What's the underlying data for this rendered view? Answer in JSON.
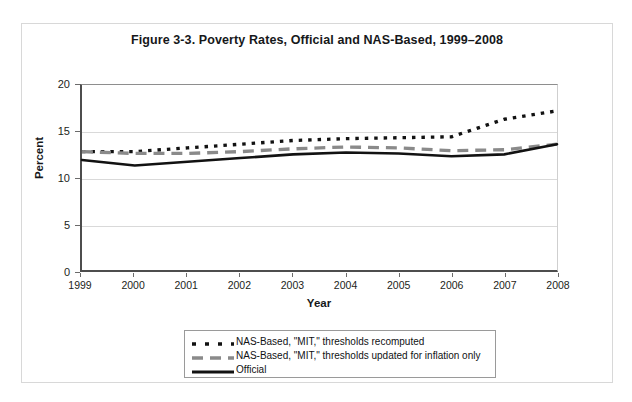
{
  "figure": {
    "title": "Figure 3-3. Poverty Rates, Official and NAS-Based, 1999–2008"
  },
  "axes": {
    "x_title": "Year",
    "y_title": "Percent",
    "y_ticks": [
      "0",
      "5",
      "10",
      "15",
      "20"
    ],
    "x_ticks": [
      "1999",
      "2000",
      "2001",
      "2002",
      "2003",
      "2004",
      "2005",
      "2006",
      "2007",
      "2008"
    ]
  },
  "legend": {
    "items": [
      {
        "label": "NAS-Based, \"MIT,\" thresholds recomputed",
        "style": "dotted",
        "color": "#121212"
      },
      {
        "label": "NAS-Based, \"MIT,\" thresholds updated for inflation only",
        "style": "dashed",
        "color": "#8a8a8a"
      },
      {
        "label": "Official",
        "style": "solid",
        "color": "#121212"
      }
    ]
  },
  "chart_data": {
    "type": "line",
    "title": "Figure 3-3. Poverty Rates, Official and NAS-Based, 1999–2008",
    "xlabel": "Year",
    "ylabel": "Percent",
    "x": [
      1999,
      2000,
      2001,
      2002,
      2003,
      2004,
      2005,
      2006,
      2007,
      2008
    ],
    "xlim": [
      1999,
      2008
    ],
    "ylim": [
      0,
      20
    ],
    "y_ticks": [
      0,
      5,
      10,
      15,
      20
    ],
    "grid": true,
    "legend_position": "below-plot",
    "series": [
      {
        "name": "NAS-Based, \"MIT,\" thresholds recomputed",
        "style": "dotted",
        "color": "#121212",
        "values": [
          12.8,
          12.8,
          13.2,
          13.6,
          14.0,
          14.2,
          14.3,
          14.4,
          16.3,
          17.2
        ]
      },
      {
        "name": "NAS-Based, \"MIT,\" thresholds updated for inflation only",
        "style": "dashed",
        "color": "#8a8a8a",
        "values": [
          12.8,
          12.6,
          12.6,
          12.8,
          13.1,
          13.3,
          13.2,
          12.9,
          13.0,
          13.6
        ]
      },
      {
        "name": "Official",
        "style": "solid",
        "color": "#121212",
        "values": [
          11.9,
          11.3,
          11.7,
          12.1,
          12.5,
          12.7,
          12.6,
          12.3,
          12.5,
          13.6
        ]
      }
    ]
  }
}
